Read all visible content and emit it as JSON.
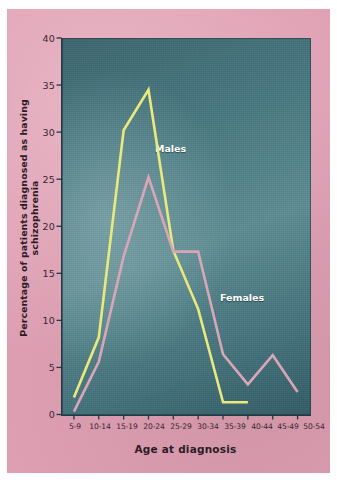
{
  "chart_data": {
    "type": "line",
    "title": "",
    "xlabel": "Age at diagnosis",
    "ylabel": "Percentage of patients diagnosed as having schizophrenia",
    "categories": [
      "5-9",
      "10-14",
      "15-19",
      "20-24",
      "25-29",
      "30-34",
      "35-39",
      "40-44",
      "45-49",
      "50-54"
    ],
    "ylim": [
      0,
      40
    ],
    "yticks": [
      0,
      5,
      10,
      15,
      20,
      25,
      30,
      35,
      40
    ],
    "ytick_labels": [
      "0",
      "5",
      "10",
      "15",
      "20",
      "25",
      "30",
      "35",
      "40"
    ],
    "grid": false,
    "legend_position": "inline-annotation",
    "series": [
      {
        "name": "Males",
        "color": "#e9e97c",
        "values": [
          1.8,
          8.2,
          30.2,
          34.5,
          17.4,
          11.2,
          1.3,
          1.3,
          null,
          null
        ]
      },
      {
        "name": "Females",
        "color": "#d9a6b8",
        "values": [
          0.3,
          5.6,
          16.8,
          25.2,
          17.3,
          17.3,
          6.4,
          3.2,
          6.3,
          2.4
        ]
      }
    ],
    "annotations": [
      {
        "text": "Males",
        "series": "Males"
      },
      {
        "text": "Females",
        "series": "Females"
      }
    ],
    "colors": {
      "panel_background": "#4b7c85",
      "mat_background": "#e0a0b4",
      "axis": "#1e3a42",
      "text": "#2d1b25",
      "annotation_text": "#ffffff"
    }
  }
}
